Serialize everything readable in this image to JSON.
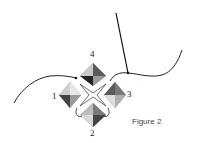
{
  "figure": {
    "caption": "Figure 2",
    "bead_labels": {
      "top": "4",
      "left": "1",
      "right": "3",
      "bottom": "2"
    }
  },
  "colors": {
    "thread": "#222222",
    "bead_dark": "#3a3a3a",
    "bead_mid": "#7a7a7a",
    "bead_light": "#c8c8c8",
    "bead_lighter": "#e6e6e6"
  }
}
